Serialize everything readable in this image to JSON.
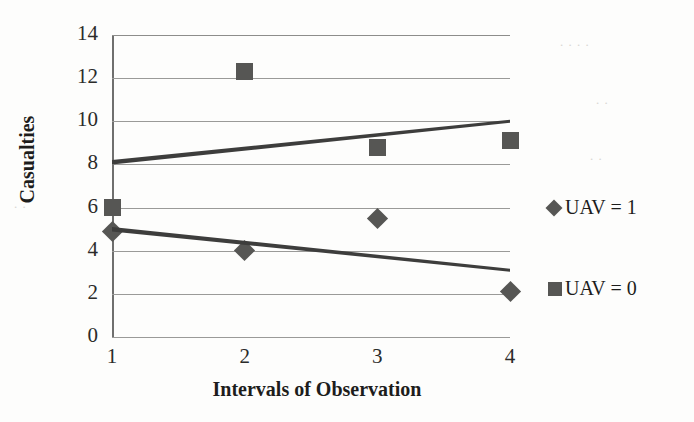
{
  "chart_data": {
    "type": "scatter",
    "title": "",
    "xlabel": "Intervals of Observation",
    "ylabel": "Casualties",
    "x": [
      1,
      2,
      3,
      4
    ],
    "xticklabels": [
      "1",
      "2",
      "3",
      "4"
    ],
    "yticklabels": [
      "0",
      "2",
      "4",
      "6",
      "8",
      "10",
      "12",
      "14"
    ],
    "ylim": [
      0,
      14
    ],
    "xlim": [
      1,
      4
    ],
    "ytick_step": 2,
    "grid": true,
    "grid_axis": "y",
    "legend_position": "right",
    "marker_color": "#565654",
    "trendline_color": "#3d3d3c",
    "gridline_color": "#9a9a98",
    "series": [
      {
        "name": "UAV = 1",
        "marker": "diamond",
        "values": [
          4.9,
          4.0,
          5.5,
          2.1
        ],
        "trendline": {
          "x_start": 1,
          "y_start": 5.0,
          "x_end": 4,
          "y_end": 3.1
        }
      },
      {
        "name": "UAV = 0",
        "marker": "square",
        "values": [
          6.0,
          12.3,
          8.8,
          9.1
        ],
        "trendline": {
          "x_start": 1,
          "y_start": 8.1,
          "x_end": 4,
          "y_end": 10.0
        }
      }
    ],
    "legend": [
      {
        "label": "UAV = 1",
        "marker": "diamond"
      },
      {
        "label": "UAV = 0",
        "marker": "square"
      }
    ]
  },
  "axis": {
    "y_ticks": [
      {
        "label": "14",
        "value": 14
      },
      {
        "label": "12",
        "value": 12
      },
      {
        "label": "10",
        "value": 10
      },
      {
        "label": "8",
        "value": 8
      },
      {
        "label": "6",
        "value": 6
      },
      {
        "label": "4",
        "value": 4
      },
      {
        "label": "2",
        "value": 2
      },
      {
        "label": "0",
        "value": 0
      }
    ],
    "x_ticks": [
      {
        "label": "1",
        "value": 1
      },
      {
        "label": "2",
        "value": 2
      },
      {
        "label": "3",
        "value": 3
      },
      {
        "label": "4",
        "value": 4
      }
    ],
    "x_title": "Intervals of Observation",
    "y_title": "Casualties"
  },
  "legend": {
    "entries": [
      {
        "label": "UAV = 1",
        "marker": "diamond"
      },
      {
        "label": "UAV = 0",
        "marker": "square"
      }
    ]
  }
}
